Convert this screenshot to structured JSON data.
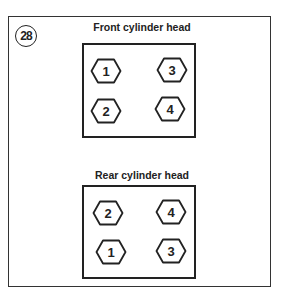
{
  "figure": {
    "number": "28"
  },
  "front": {
    "title": "Front cylinder head",
    "bolts": [
      {
        "label": "1",
        "x": 90,
        "y": 58
      },
      {
        "label": "3",
        "x": 156,
        "y": 57
      },
      {
        "label": "2",
        "x": 90,
        "y": 98
      },
      {
        "label": "4",
        "x": 154,
        "y": 96
      }
    ]
  },
  "rear": {
    "title": "Rear cylinder head",
    "bolts": [
      {
        "label": "2",
        "x": 92,
        "y": 200
      },
      {
        "label": "4",
        "x": 155,
        "y": 199
      },
      {
        "label": "1",
        "x": 95,
        "y": 239
      },
      {
        "label": "3",
        "x": 155,
        "y": 238
      }
    ]
  },
  "colors": {
    "line": "#222222",
    "background": "#ffffff"
  }
}
